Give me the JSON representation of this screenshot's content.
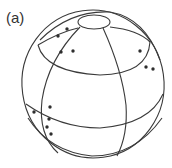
{
  "figure": {
    "panel_label": "(a)",
    "colors": {
      "line": "#3a3a3a",
      "dot": "#2e2e2e",
      "background": "#ffffff"
    },
    "sphere": {
      "center": [
        93,
        84
      ],
      "rx": 71,
      "ry": 74
    },
    "pole_cap": {
      "center": [
        94,
        22
      ],
      "rx": 16,
      "ry": 7
    },
    "points": [
      {
        "x": 58,
        "y": 36
      },
      {
        "x": 67,
        "y": 29
      },
      {
        "x": 61,
        "y": 52
      },
      {
        "x": 73,
        "y": 51
      },
      {
        "x": 140,
        "y": 51
      },
      {
        "x": 146,
        "y": 67
      },
      {
        "x": 153,
        "y": 69
      },
      {
        "x": 50,
        "y": 107
      },
      {
        "x": 34,
        "y": 112
      },
      {
        "x": 49,
        "y": 119
      },
      {
        "x": 47,
        "y": 127
      },
      {
        "x": 51,
        "y": 134
      }
    ]
  }
}
